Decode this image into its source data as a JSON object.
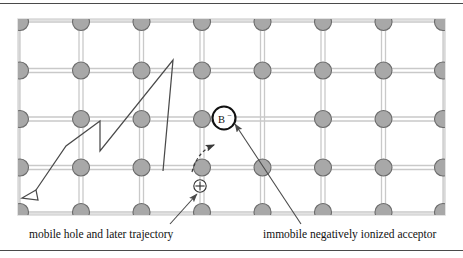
{
  "figure": {
    "type": "semiconductor-lattice-diagram",
    "title": "",
    "frame": {
      "has_top_rule": true,
      "has_bottom_rule": true,
      "rule_color": "#4a4a4a"
    },
    "lattice": {
      "box": {
        "x": 18,
        "y": 19,
        "width": 427,
        "height": 196
      },
      "border_color": "#d8d8d8",
      "atom_fill": "#a8a8a8",
      "atom_stroke": "#6b6b6b",
      "atom_radius": 8.5,
      "bond_color": "#c9c9c9",
      "columns": 8,
      "rows": 5,
      "col_spacing": 60.5,
      "row_spacing": 48.5
    },
    "acceptor": {
      "label": "B",
      "charge": "−",
      "x": 224,
      "y": 118,
      "radius": 12,
      "stroke": "#111111"
    },
    "hole": {
      "symbol": "⊕",
      "x": 200,
      "y": 186,
      "radius": 6.5
    },
    "trajectory": {
      "stroke": "#4a4a4a",
      "points": "163,171 100,200 100,151 66,177 29,198",
      "arrow": "open-triangle-down-left"
    },
    "jump_arrow": {
      "style": "dashed-curve",
      "from": "hole",
      "to": "acceptor"
    },
    "leaders": [
      {
        "name": "mobile-hole-leader",
        "from": [
          170,
          222
        ],
        "to": [
          196,
          193
        ]
      },
      {
        "name": "acceptor-leader",
        "from": [
          300,
          222
        ],
        "to": [
          236,
          125
        ]
      }
    ]
  },
  "labels": {
    "left": "mobile hole and later trajectory",
    "right": "immobile negatively ionized acceptor"
  },
  "colors": {
    "atom": "#a8a8a8",
    "bond": "#c9c9c9",
    "line": "#4a4a4a",
    "text": "#111111"
  }
}
